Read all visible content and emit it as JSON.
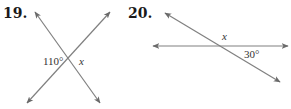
{
  "problems": [
    {
      "number": "19.",
      "angle_label": "110°",
      "unknown_label": "x",
      "lines": [
        {
          "x1": 35,
          "y1": 12,
          "x2": 100,
          "y2": 103
        },
        {
          "x1": 110,
          "y1": 12,
          "x2": 27,
          "y2": 103
        }
      ],
      "intersection": {
        "x": 69,
        "y": 60
      },
      "angle_label_pos": {
        "x": 43,
        "y": 65
      },
      "unknown_label_pos": {
        "x": 79,
        "y": 65
      }
    },
    {
      "number": "20.",
      "angle_label": "30°",
      "unknown_label": "x",
      "lines": [
        {
          "x1": 165,
          "y1": 13,
          "x2": 280,
          "y2": 82
        },
        {
          "x1": 153,
          "y1": 46,
          "x2": 288,
          "y2": 46
        }
      ],
      "intersection": {
        "x": 218,
        "y": 46
      },
      "angle_label_pos": {
        "x": 244,
        "y": 58
      },
      "unknown_label_pos": {
        "x": 222,
        "y": 40
      }
    }
  ],
  "colors": {
    "line": "#808080",
    "arrowhead": "#6a6a6a",
    "text": "#1a1a1a"
  }
}
